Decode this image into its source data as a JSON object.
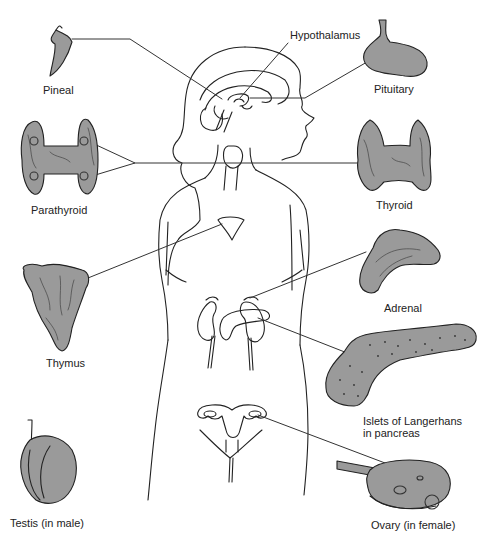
{
  "diagram": {
    "colors": {
      "background": "#ffffff",
      "outline": "#222222",
      "gland_fill": "#9a9a9a",
      "leader_line": "#333333"
    },
    "labels": {
      "hypothalamus": "Hypothalamus",
      "pineal": "Pineal",
      "pituitary": "Pituitary",
      "parathyroid": "Parathyroid",
      "thyroid": "Thyroid",
      "thymus": "Thymus",
      "adrenal": "Adrenal",
      "islets_line1": "Islets of Langerhans",
      "islets_line2": "in pancreas",
      "testis": "Testis (in male)",
      "ovary": "Ovary (in female)"
    }
  }
}
